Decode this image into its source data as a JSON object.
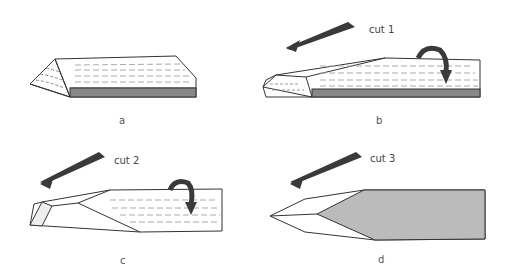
{
  "panels": [
    {
      "id": "a",
      "label": "a",
      "cut_label": ""
    },
    {
      "id": "b",
      "label": "b",
      "cut_label": "cut 1"
    },
    {
      "id": "c",
      "label": "c",
      "cut_label": "cut 2"
    },
    {
      "id": "d",
      "label": "d",
      "cut_label": "cut 3"
    }
  ],
  "colors": {
    "ink": "#333333",
    "arrow": "#3a3a3a",
    "shade": "#777777"
  }
}
